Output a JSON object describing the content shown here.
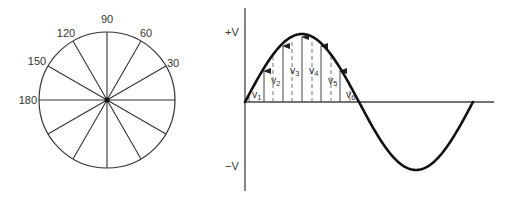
{
  "phasor_circle": {
    "center": [
      107,
      100
    ],
    "radius": 68,
    "spoke_step_deg": 30,
    "angle_labels": [
      {
        "text": "90",
        "x": 107,
        "y": 23,
        "anchor": "middle"
      },
      {
        "text": "60",
        "x": 146,
        "y": 37,
        "anchor": "middle"
      },
      {
        "text": "30",
        "x": 173,
        "y": 67,
        "anchor": "middle"
      },
      {
        "text": "120",
        "x": 66,
        "y": 37,
        "anchor": "middle"
      },
      {
        "text": "150",
        "x": 37,
        "y": 65,
        "anchor": "middle"
      },
      {
        "text": "180",
        "x": 37,
        "y": 104,
        "anchor": "end"
      }
    ]
  },
  "sine_wave": {
    "axis_labels": {
      "plus": "+V",
      "minus": "−V"
    },
    "origin": [
      245,
      102
    ],
    "half_period_px": 114,
    "amplitude_px": 68,
    "instantaneous_values": [
      {
        "name": "v",
        "sub": "1",
        "x": 252,
        "y": 98
      },
      {
        "name": "v",
        "sub": "2",
        "x": 271,
        "y": 84
      },
      {
        "name": "v",
        "sub": "3",
        "x": 290,
        "y": 74
      },
      {
        "name": "v",
        "sub": "4",
        "x": 309,
        "y": 74
      },
      {
        "name": "v",
        "sub": "5",
        "x": 328,
        "y": 84
      },
      {
        "name": "v",
        "sub": "6",
        "x": 346,
        "y": 98
      }
    ],
    "solid_arrow_x": [
      264,
      283,
      302,
      321,
      340
    ],
    "dashed_x": [
      273,
      292,
      312,
      331,
      350
    ],
    "short_line_x": [
      249
    ]
  }
}
